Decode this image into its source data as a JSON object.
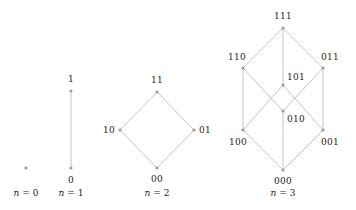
{
  "figure": {
    "background_color": "#ffffff",
    "node_color": "#9a9a9a",
    "edge_color": "#b4b4b4",
    "label_color": "#1a1a1a",
    "width": 356,
    "height": 210
  },
  "chart_data": {
    "type": "diagram",
    "panels": [
      {
        "caption": "n = 0",
        "caption_x": 26,
        "caption_y": 193,
        "nodes": [
          {
            "label": "",
            "x": 26,
            "y": 168,
            "label_x": 26,
            "label_y": 168,
            "label_visible": false
          }
        ],
        "edges": []
      },
      {
        "caption": "n = 1",
        "caption_x": 71,
        "caption_y": 193,
        "nodes": [
          {
            "label": "1",
            "x": 71,
            "y": 91,
            "label_x": 71,
            "label_y": 79,
            "label_visible": true
          },
          {
            "label": "0",
            "x": 71,
            "y": 168,
            "label_x": 71,
            "label_y": 180,
            "label_visible": true
          }
        ],
        "edges": [
          [
            0,
            1
          ]
        ]
      },
      {
        "caption": "n = 2",
        "caption_x": 157,
        "caption_y": 193,
        "nodes": [
          {
            "label": "11",
            "x": 157,
            "y": 92,
            "label_x": 157,
            "label_y": 80,
            "label_visible": true
          },
          {
            "label": "10",
            "x": 120,
            "y": 130,
            "label_x": 109,
            "label_y": 130,
            "label_visible": true
          },
          {
            "label": "01",
            "x": 194,
            "y": 130,
            "label_x": 205,
            "label_y": 130,
            "label_visible": true
          },
          {
            "label": "00",
            "x": 157,
            "y": 168,
            "label_x": 157,
            "label_y": 179,
            "label_visible": true
          }
        ],
        "edges": [
          [
            0,
            1
          ],
          [
            0,
            2
          ],
          [
            1,
            3
          ],
          [
            2,
            3
          ]
        ]
      },
      {
        "caption": "n = 3",
        "caption_x": 283,
        "caption_y": 193,
        "nodes": [
          {
            "label": "111",
            "x": 283,
            "y": 28,
            "label_x": 283,
            "label_y": 16,
            "label_visible": true
          },
          {
            "label": "110",
            "x": 243,
            "y": 68,
            "label_x": 237,
            "label_y": 57,
            "label_visible": true
          },
          {
            "label": "101",
            "x": 283,
            "y": 85,
            "label_x": 296,
            "label_y": 77,
            "label_visible": true
          },
          {
            "label": "011",
            "x": 323,
            "y": 68,
            "label_x": 330,
            "label_y": 57,
            "label_visible": true
          },
          {
            "label": "100",
            "x": 243,
            "y": 130,
            "label_x": 238,
            "label_y": 142,
            "label_visible": true
          },
          {
            "label": "010",
            "x": 283,
            "y": 111,
            "label_x": 296,
            "label_y": 119,
            "label_visible": true
          },
          {
            "label": "001",
            "x": 323,
            "y": 130,
            "label_x": 330,
            "label_y": 142,
            "label_visible": true
          },
          {
            "label": "000",
            "x": 283,
            "y": 170,
            "label_x": 283,
            "label_y": 181,
            "label_visible": true
          }
        ],
        "edges": [
          [
            0,
            1
          ],
          [
            0,
            2
          ],
          [
            0,
            3
          ],
          [
            1,
            4
          ],
          [
            1,
            5
          ],
          [
            2,
            4
          ],
          [
            2,
            6
          ],
          [
            3,
            5
          ],
          [
            3,
            6
          ],
          [
            4,
            7
          ],
          [
            5,
            7
          ],
          [
            6,
            7
          ]
        ]
      }
    ]
  }
}
